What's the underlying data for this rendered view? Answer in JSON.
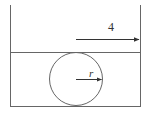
{
  "diagram": {
    "type": "geometry",
    "labels": {
      "width_label": "4",
      "radius_label": "r"
    },
    "colors": {
      "stroke": "#555555",
      "text": "#333333"
    },
    "elements": {
      "left_wall": {
        "x": 10,
        "y1": 5,
        "y2": 106
      },
      "right_wall": {
        "x": 140,
        "y1": 5,
        "y2": 106
      },
      "middle_line": {
        "y": 52,
        "x1": 10,
        "x2": 140
      },
      "bottom_line": {
        "y": 106,
        "x1": 10,
        "x2": 140
      },
      "circle": {
        "cx": 76,
        "cy": 79,
        "r": 26
      },
      "width_arrow": {
        "x1": 76,
        "x2": 140,
        "y": 39
      },
      "radius_arrow": {
        "x1": 76,
        "x2": 101,
        "y": 79
      }
    }
  }
}
